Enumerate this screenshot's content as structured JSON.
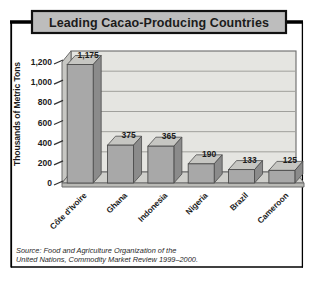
{
  "title": "Leading Cacao-Producing Countries",
  "chart_data": {
    "type": "bar",
    "style": "3d-gray-print",
    "title": "Leading Cacao-Producing Countries",
    "categories": [
      "Côte d'Ivoire",
      "Ghana",
      "Indonesia",
      "Nigeria",
      "Brazil",
      "Cameroon"
    ],
    "values": [
      1175,
      375,
      365,
      190,
      133,
      125
    ],
    "value_labels": [
      "1,175",
      "375",
      "365",
      "190",
      "133",
      "125"
    ],
    "xlabel": "",
    "ylabel": "Thousands of Metric Tons",
    "ylim": [
      0,
      1200
    ],
    "ytick_step": 200,
    "ytick_labels": [
      "0",
      "200",
      "400",
      "600",
      "800",
      "1,000",
      "1,200"
    ],
    "grid": true,
    "legend": "none"
  },
  "source": {
    "line1": "Source: Food and Agriculture Organization of the",
    "line2": "United Nations, Commodity Market Review 1999–2000."
  },
  "colors": {
    "frame": "#000000",
    "title_box_fill": "#bdbdbd",
    "title_box_stroke": "#111111",
    "back_wall": "#e5e5e1",
    "left_wall": "#c7c7c3",
    "floor": "#cfcfcb",
    "floor_front": "#b9b9b5",
    "gridline": "#a0a09c",
    "wall_outline": "#6b6b6b",
    "bar_front": "#a8a8a8",
    "bar_top": "#c6c6c2",
    "bar_side": "#8b8b8b",
    "bar_outline": "#4d4d4d",
    "text": "#1b1b1b"
  }
}
